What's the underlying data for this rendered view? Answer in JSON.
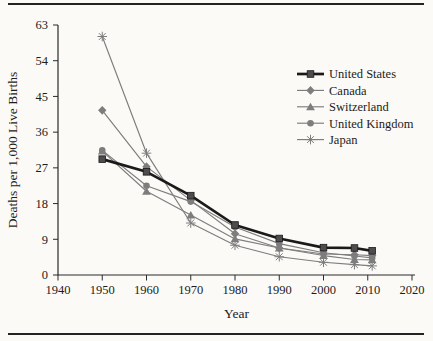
{
  "chart_data": {
    "type": "line",
    "title": "",
    "xlabel": "Year",
    "ylabel": "Deaths per 1,000 Live Births",
    "xlim": [
      1940,
      2020
    ],
    "ylim": [
      0,
      63
    ],
    "x_ticks": [
      1940,
      1950,
      1960,
      1970,
      1980,
      1990,
      2000,
      2010,
      2020
    ],
    "y_ticks": [
      0,
      9,
      18,
      27,
      36,
      45,
      54,
      63
    ],
    "grid": false,
    "legend_position": "inside-top-right",
    "x": [
      1950,
      1960,
      1970,
      1980,
      1990,
      2000,
      2007,
      2011
    ],
    "series": [
      {
        "name": "United States",
        "marker": "square",
        "color": "#1a1a1a",
        "marker_fill": "#4d4d4d",
        "line_width": 2.7,
        "values": [
          29.2,
          26.0,
          20.0,
          12.6,
          9.2,
          6.9,
          6.8,
          6.1
        ]
      },
      {
        "name": "Canada",
        "marker": "diamond",
        "color": "#7d7d7d",
        "marker_fill": "#7d7d7d",
        "line_width": 1.15,
        "values": [
          41.5,
          27.3,
          18.8,
          10.4,
          6.8,
          5.3,
          5.1,
          4.9
        ]
      },
      {
        "name": "Switzerland",
        "marker": "triangle",
        "color": "#7d7d7d",
        "marker_fill": "#7d7d7d",
        "line_width": 1.15,
        "values": [
          31.2,
          21.1,
          15.1,
          9.1,
          6.8,
          4.9,
          3.9,
          3.8
        ]
      },
      {
        "name": "United Kingdom",
        "marker": "circle",
        "color": "#7d7d7d",
        "marker_fill": "#7d7d7d",
        "line_width": 1.15,
        "values": [
          31.4,
          22.5,
          18.5,
          12.1,
          7.9,
          5.6,
          4.8,
          4.3
        ]
      },
      {
        "name": "Japan",
        "marker": "asterisk",
        "color": "#7d7d7d",
        "marker_fill": "#7d7d7d",
        "line_width": 1.15,
        "values": [
          60.1,
          30.7,
          13.1,
          7.5,
          4.6,
          3.2,
          2.6,
          2.3
        ]
      }
    ],
    "axis_color": "#2b2b2b",
    "tick_font_px": 12.5,
    "label_font_px": 13.5
  }
}
